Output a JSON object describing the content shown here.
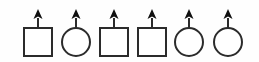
{
  "figure": {
    "background_color": "#fefefe",
    "stroke_color": "#2b2b2b",
    "arrow_fill_color": "#111111",
    "shape_fill_color": "#ffffff",
    "canvas": {
      "width": 259,
      "height": 62
    },
    "sequence_pattern": "square, circle, square, square, circle, circle",
    "item_count": 6,
    "items": [
      {
        "index": 1,
        "shape": "square",
        "label": "square-with-up-arrow",
        "cx": 38,
        "cy": 42,
        "size": 28,
        "arrow": {
          "tip_y": 9,
          "head_height": 10,
          "head_width": 9,
          "base_y": 28
        }
      },
      {
        "index": 2,
        "shape": "circle",
        "label": "circle-with-up-arrow",
        "cx": 76,
        "cy": 42,
        "size": 28,
        "arrow": {
          "tip_y": 9,
          "head_height": 10,
          "head_width": 9,
          "base_y": 28
        }
      },
      {
        "index": 3,
        "shape": "square",
        "label": "square-with-up-arrow",
        "cx": 114,
        "cy": 42,
        "size": 28,
        "arrow": {
          "tip_y": 9,
          "head_height": 10,
          "head_width": 9,
          "base_y": 28
        }
      },
      {
        "index": 4,
        "shape": "square",
        "label": "square-with-up-arrow",
        "cx": 152,
        "cy": 42,
        "size": 28,
        "arrow": {
          "tip_y": 9,
          "head_height": 10,
          "head_width": 9,
          "base_y": 28
        }
      },
      {
        "index": 5,
        "shape": "circle",
        "label": "circle-with-up-arrow",
        "cx": 189,
        "cy": 42,
        "size": 28,
        "arrow": {
          "tip_y": 9,
          "head_height": 10,
          "head_width": 9,
          "base_y": 28
        }
      },
      {
        "index": 6,
        "shape": "circle",
        "label": "circle-with-up-arrow",
        "cx": 228,
        "cy": 42,
        "size": 28,
        "arrow": {
          "tip_y": 9,
          "head_height": 10,
          "head_width": 9,
          "base_y": 28
        }
      }
    ]
  }
}
